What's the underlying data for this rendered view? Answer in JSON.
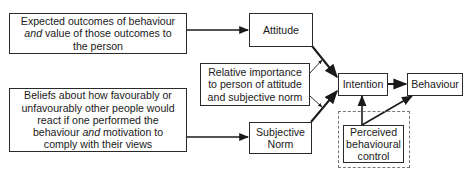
{
  "diagram": {
    "type": "flowchart",
    "title": "",
    "nodes": {
      "outcomes": {
        "lines": [
          "Expected outcomes of behaviour",
          "and value of those outcomes to",
          "the person"
        ],
        "emphasis": "and"
      },
      "beliefs": {
        "lines": [
          "Beliefs about how favourably or",
          "unfavourably other people would",
          "react if one performed the",
          "behaviour and motivation to",
          "comply with their views"
        ],
        "emphasis": "and"
      },
      "attitude": {
        "lines": [
          "Attitude"
        ]
      },
      "relative_importance": {
        "lines": [
          "Relative importance",
          "to person of attitude",
          "and subjective norm"
        ]
      },
      "subjective_norm": {
        "lines": [
          "Subjective",
          "Norm"
        ]
      },
      "intention": {
        "lines": [
          "Intention"
        ]
      },
      "behaviour": {
        "lines": [
          "Behaviour"
        ]
      },
      "perceived_control": {
        "lines": [
          "Perceived",
          "behavioural",
          "control"
        ],
        "container": "dashed-box"
      }
    },
    "edges": [
      {
        "from": "outcomes",
        "to": "attitude",
        "style": "arrow"
      },
      {
        "from": "beliefs",
        "to": "subjective_norm",
        "style": "arrow"
      },
      {
        "from": "attitude",
        "to": "intention",
        "style": "thick-arrow"
      },
      {
        "from": "subjective_norm",
        "to": "intention",
        "style": "thick-arrow"
      },
      {
        "from": "relative_importance",
        "to": "attitude->intention",
        "style": "thin-arrow"
      },
      {
        "from": "relative_importance",
        "to": "subjective_norm->intention",
        "style": "thin-arrow"
      },
      {
        "from": "intention",
        "to": "behaviour",
        "style": "thick-arrow"
      },
      {
        "from": "perceived_control",
        "to": "intention",
        "style": "arrow"
      },
      {
        "from": "perceived_control",
        "to": "behaviour",
        "style": "arrow"
      }
    ],
    "colors": {
      "stroke": "#2a2a2a",
      "dashed": "#777777",
      "background": "#ffffff"
    }
  }
}
